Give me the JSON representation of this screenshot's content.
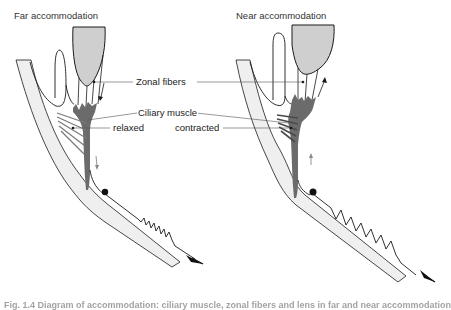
{
  "panels": [
    {
      "title": "Far accommodation",
      "state": "relaxed",
      "zonule_tension_arrow": "down",
      "spring": "compressed"
    },
    {
      "title": "Near accommodation",
      "state": "contracted",
      "zonule_tension_arrow": "up",
      "spring": "stretched"
    }
  ],
  "labels": {
    "zonal_fibers": "Zonal fibers",
    "ciliary_muscle": "Ciliary muscle",
    "relaxed": "relaxed",
    "contracted": "contracted"
  },
  "caption": "Fig. 1.4 Diagram of accommodation: ciliary muscle, zonal fibers and lens in far and near accommodation",
  "colors": {
    "lens_fill": "#cfcfcf",
    "muscle_fill": "#6b6b6b",
    "sclera_fill": "#efefef",
    "line": "#1a1a1a",
    "leader": "#555555"
  }
}
